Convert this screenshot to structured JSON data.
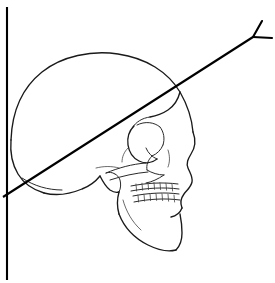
{
  "figure": {
    "background_color": "#ffffff",
    "width": 275,
    "height": 283,
    "line_color": "#1a1a1a",
    "reference_line_color": "#000000"
  },
  "reference_lines": {
    "vertical": {
      "name": "vertical-reference-line",
      "x1": 7,
      "y1": 7,
      "x2": 7,
      "y2": 280,
      "color": "#000000",
      "stroke_width": 2.1
    },
    "diagonal": {
      "name": "diagonal-reference-line",
      "x1": 3,
      "y1": 197,
      "x2": 253,
      "y2": 37,
      "color": "#000000",
      "stroke_width": 2.1
    },
    "fork": {
      "name": "diagonal-line-fork-terminus",
      "vertex_x": 253,
      "vertex_y": 37,
      "branch_upper_x": 262,
      "branch_upper_y": 21,
      "branch_right_x": 272,
      "branch_right_y": 38
    },
    "intersection": {
      "name": "line-intersection-point",
      "x": 7,
      "y": 194
    }
  },
  "anatomy": {
    "parts": [
      {
        "name": "cranial-vault",
        "label": "Cranial vault (calvaria)"
      },
      {
        "name": "frontal-bone",
        "label": "Frontal bone"
      },
      {
        "name": "parietal-bone",
        "label": "Parietal bone"
      },
      {
        "name": "occipital-bone",
        "label": "Occipital bone"
      },
      {
        "name": "temporal-bone",
        "label": "Temporal bone"
      },
      {
        "name": "mastoid-process",
        "label": "Mastoid process"
      },
      {
        "name": "orbit",
        "label": "Orbit (eye socket)"
      },
      {
        "name": "nasal-bone",
        "label": "Nasal bone"
      },
      {
        "name": "nasal-aperture",
        "label": "Nasal aperture"
      },
      {
        "name": "zygomatic-arch",
        "label": "Zygomatic arch"
      },
      {
        "name": "maxilla",
        "label": "Maxilla"
      },
      {
        "name": "mandible",
        "label": "Mandible"
      },
      {
        "name": "upper-teeth",
        "label": "Upper dental arch"
      },
      {
        "name": "lower-teeth",
        "label": "Lower dental arch"
      },
      {
        "name": "mental-protuberance",
        "label": "Chin"
      }
    ]
  },
  "paths": {
    "cranial_vault": "M 11,140 C 12,112 22,88 42,72 C 62,56 92,50 118,54 C 146,58 168,72 180,92 C 188,106 192,120 193,132",
    "occiput_lower_left": "M 11,140 C 10,152 12,164 18,174 C 24,184 34,190 44,193",
    "skull_base_rear": "M 44,193 C 56,196 70,194 82,189 C 90,186 96,181 100,176",
    "mastoid_notch": "M 100,176 C 103,182 106,187 110,190 C 113,192 116,193 119,192",
    "styloid_area": "M 119,192 C 121,188 121,184 120,180 C 119,177 117,175 115,174",
    "temporal_fossa_edge": "M 115,174 C 112,172 109,172 106,173",
    "zygomatic_arch_top": "M 106,173 C 118,168 132,164 146,163",
    "zygomatic_arch_bottom": "M 110,180 C 122,176 136,173 148,172",
    "facial_profile": "M 193,132 C 196,140 195,148 191,154 C 188,159 186,163 188,168 C 190,173 193,177 192,182 C 191,187 187,190 184,194 C 181,198 180,203 182,208",
    "forehead_to_brow": "M 180,92 C 178,100 174,106 168,110 C 162,114 156,116 150,117",
    "brow_ridge": "M 150,117 C 142,118 136,122 132,128",
    "orbit_outer": "M 134,126 C 129,131 127,138 128,145 C 129,152 133,158 139,161 C 145,164 152,163 157,159",
    "orbit_inner_upper": "M 137,125 C 145,121 154,122 160,127",
    "orbit_lower_rim": "M 157,159 C 152,157 148,153 146,148",
    "orbit_medial": "M 160,127 C 164,132 165,139 163,145",
    "nasal_root": "M 163,145 C 161,150 157,154 152,156",
    "nasal_aperture_edge": "M 152,156 C 148,160 146,165 147,170",
    "infraorbital_margin": "M 147,170 C 152,173 158,175 164,175",
    "maxilla_front": "M 182,208 C 180,213 176,216 171,217",
    "maxilla_cheek": "M 164,175 C 158,179 152,182 146,183",
    "upper_alveolar": "M 131,186 C 146,183 163,182 178,184",
    "upper_teeth_line": "M 131,191 C 147,188 164,187 179,189",
    "lower_alveolar": "M 133,196 C 148,193 165,192 179,194",
    "lower_teeth_line": "M 134,202 C 149,199 165,198 180,200",
    "mandible_ramus": "M 119,192 C 117,199 117,207 119,214",
    "mandible_body": "M 119,214 C 124,227 134,238 148,245 C 158,250 168,252 176,250",
    "mandible_chin": "M 176,250 C 180,246 182,240 182,233 C 182,226 181,219 180,214",
    "mandible_inner": "M 123,200 C 126,211 132,222 141,230",
    "occipital_detail": "M 22,178 C 34,186 48,190 62,190",
    "temporal_line": "M 96,168 C 104,166 112,166 119,168",
    "sphenoid_curve": "M 128,148 C 124,152 122,157 122,162",
    "nasal_bone_crest": "M 168,150 C 170,156 170,162 168,167"
  },
  "teeth": {
    "upper_divisions_x": [
      136,
      142,
      148,
      154,
      160,
      166,
      172
    ],
    "lower_divisions_x": [
      138,
      144,
      150,
      156,
      162,
      168,
      174
    ],
    "upper_y_top": 184,
    "upper_y_bottom": 191,
    "lower_y_top": 195,
    "lower_y_bottom": 202
  }
}
